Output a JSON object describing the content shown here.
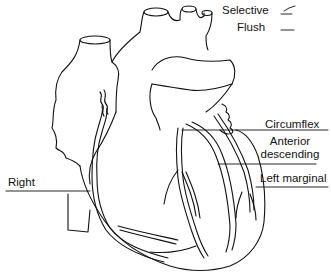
{
  "diagram": {
    "legend": [
      {
        "label": "Selective",
        "symbol": "checkmark-line-icon"
      },
      {
        "label": "Flush",
        "symbol": "straight-line-icon"
      }
    ],
    "labels": {
      "circumflex": "Circumflex",
      "anterior_descending_line1": "Anterior",
      "anterior_descending_line2": "descending",
      "left_marginal": "Left marginal",
      "right": "Right"
    },
    "colors": {
      "stroke": "#111111",
      "background": "#ffffff"
    }
  }
}
